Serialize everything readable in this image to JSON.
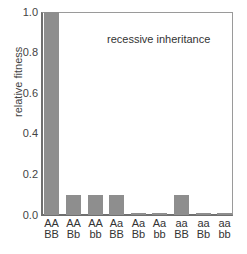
{
  "chart_data": {
    "type": "bar",
    "title": "",
    "annotation": "recessive inheritance",
    "xlabel": "",
    "ylabel": "relative fitness",
    "ylim": [
      0,
      1.0
    ],
    "yticks": [
      "0.0",
      "0.2",
      "0.4",
      "0.6",
      "0.8",
      "1.0"
    ],
    "grid": false,
    "legend": null,
    "categories": [
      {
        "top": "AA",
        "bottom": "BB"
      },
      {
        "top": "AA",
        "bottom": "Bb"
      },
      {
        "top": "AA",
        "bottom": "bb"
      },
      {
        "top": "Aa",
        "bottom": "BB"
      },
      {
        "top": "Aa",
        "bottom": "Bb"
      },
      {
        "top": "Aa",
        "bottom": "bb"
      },
      {
        "top": "aa",
        "bottom": "BB"
      },
      {
        "top": "aa",
        "bottom": "Bb"
      },
      {
        "top": "aa",
        "bottom": "bb"
      }
    ],
    "category_labels": [
      "AA BB",
      "AA Bb",
      "AA bb",
      "Aa BB",
      "Aa Bb",
      "Aa bb",
      "aa BB",
      "aa Bb",
      "aa bb"
    ],
    "values": [
      1.0,
      0.1,
      0.1,
      0.1,
      0.01,
      0.01,
      0.1,
      0.01,
      0.01
    ],
    "bar_color": "#8e8e8e",
    "axis_color": "#6f6f6f"
  }
}
